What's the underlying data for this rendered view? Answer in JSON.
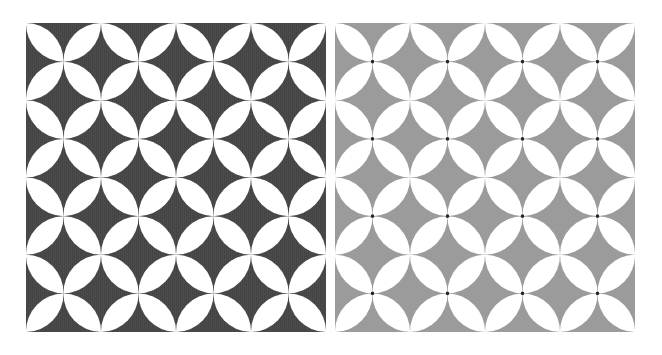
{
  "panels": [
    {
      "id": "left",
      "pattern": "shippo-seven-treasures",
      "background": "#4b4b4b",
      "stripe": "#3f3f3f",
      "petal": "#ffffff",
      "junction_dot": null,
      "cols": 8,
      "rows": 8
    },
    {
      "id": "right",
      "pattern": "shippo-seven-treasures",
      "background": "#9b9b9b",
      "stripe": null,
      "petal": "#ffffff",
      "junction_dot": "#2a2a2a",
      "cols": 8,
      "rows": 8
    }
  ]
}
